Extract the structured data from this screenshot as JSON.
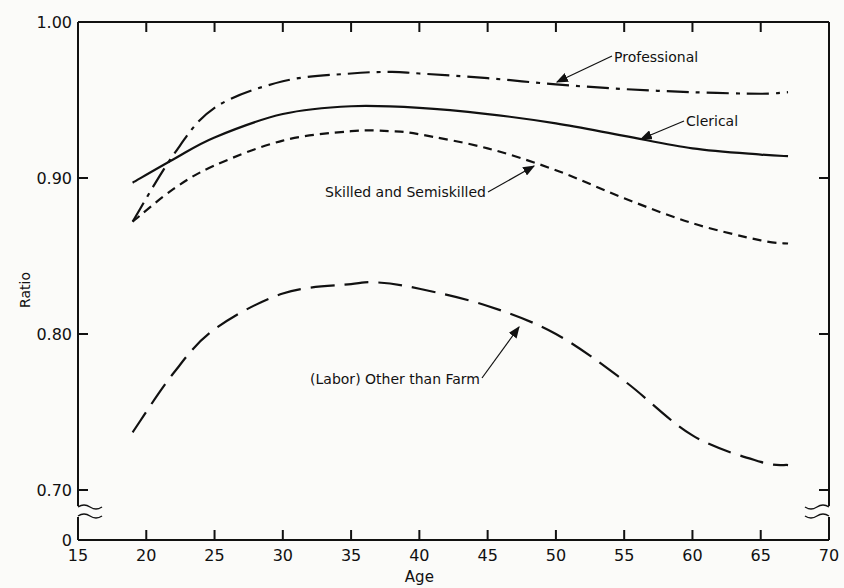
{
  "chart_data": {
    "type": "line",
    "title": "",
    "xlabel": "Age",
    "ylabel": "Ratio",
    "xlim": [
      15,
      70
    ],
    "ylim": [
      0.7,
      1.0
    ],
    "y_axis_break": true,
    "y_origin_label": "0",
    "grid": false,
    "x_ticks": [
      "15",
      "20",
      "25",
      "30",
      "35",
      "40",
      "45",
      "50",
      "55",
      "60",
      "65",
      "70"
    ],
    "y_ticks": [
      "0.70",
      "0.80",
      "0.90",
      "1.00"
    ],
    "series": [
      {
        "name": "Professional",
        "style": "dash-dot",
        "x": [
          19,
          22,
          25,
          30,
          35,
          38,
          40,
          45,
          50,
          55,
          60,
          65,
          67
        ],
        "values": [
          0.872,
          0.915,
          0.945,
          0.962,
          0.967,
          0.968,
          0.967,
          0.964,
          0.96,
          0.957,
          0.955,
          0.954,
          0.955
        ]
      },
      {
        "name": "Clerical",
        "style": "solid",
        "x": [
          19,
          22,
          25,
          30,
          35,
          40,
          45,
          50,
          55,
          60,
          65,
          67
        ],
        "values": [
          0.897,
          0.912,
          0.926,
          0.941,
          0.946,
          0.945,
          0.941,
          0.935,
          0.927,
          0.919,
          0.915,
          0.914
        ]
      },
      {
        "name": "Skilled and Semiskilled",
        "style": "short-dash",
        "x": [
          19,
          22,
          25,
          30,
          35,
          38,
          40,
          45,
          50,
          55,
          60,
          65,
          67
        ],
        "values": [
          0.872,
          0.893,
          0.908,
          0.924,
          0.93,
          0.93,
          0.928,
          0.919,
          0.905,
          0.887,
          0.871,
          0.86,
          0.858
        ]
      },
      {
        "name": "(Labor) Other than Farm",
        "style": "long-dash",
        "x": [
          19,
          22,
          25,
          30,
          35,
          37,
          40,
          45,
          50,
          55,
          60,
          65,
          67
        ],
        "values": [
          0.737,
          0.775,
          0.803,
          0.826,
          0.832,
          0.833,
          0.829,
          0.818,
          0.8,
          0.77,
          0.735,
          0.718,
          0.716
        ]
      }
    ],
    "annotations": [
      {
        "text": "Professional",
        "arrow_to_age": 50
      },
      {
        "text": "Clerical",
        "arrow_to_age": 55
      },
      {
        "text": "Skilled and Semiskilled",
        "arrow_to_age": 50
      },
      {
        "text": "(Labor) Other than Farm",
        "arrow_to_age": 49
      }
    ]
  }
}
